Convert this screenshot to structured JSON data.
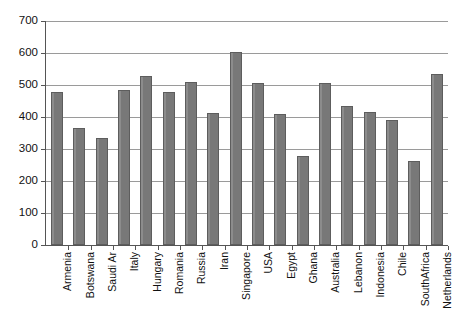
{
  "chart_data": {
    "type": "bar",
    "title": "",
    "subtitle": "",
    "xlabel": "",
    "ylabel": "",
    "ylim": [
      0,
      700
    ],
    "ytick_step": 100,
    "yticks": [
      0,
      100,
      200,
      300,
      400,
      500,
      600,
      700
    ],
    "ytick_labels": [
      "0",
      "100",
      "200",
      "300",
      "400",
      "500",
      "600",
      "700"
    ],
    "grid": "horizontal",
    "legend": "none",
    "bar_color": "#7c7c7c",
    "bar_edge_color": "#5d5d5d",
    "gridline_color": "#9a9a9a",
    "axis_color": "#555555",
    "categories": [
      "Armenia",
      "Botswana",
      "Saudi Ar",
      "Italy",
      "Hungary",
      "Romania",
      "Russia",
      "Iran",
      "Singapore",
      "USA",
      "Egypt",
      "Ghana",
      "Australia",
      "Lebanon",
      "Indonesia",
      "Chile",
      "SouthAfrica",
      "Netherlands"
    ],
    "values": [
      478,
      365,
      334,
      484,
      527,
      477,
      509,
      413,
      603,
      505,
      409,
      277,
      505,
      435,
      417,
      390,
      264,
      533
    ]
  }
}
